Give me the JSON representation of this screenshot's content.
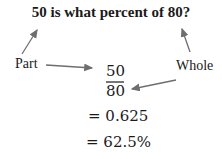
{
  "question": "50 is what percent of 80?",
  "labels": {
    "part": "Part",
    "whole": "Whole"
  },
  "fraction": {
    "numerator": "50",
    "denominator": "80"
  },
  "steps": [
    "= 0.625",
    "= 62.5%"
  ],
  "colors": {
    "arrow": "#6e6e6e",
    "text": "#1a1a1a"
  }
}
